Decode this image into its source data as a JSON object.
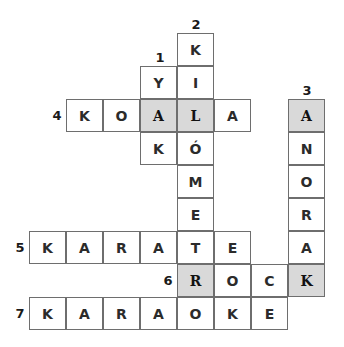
{
  "puzzle": {
    "type": "crossword",
    "cell_size": {
      "w": 37,
      "h": 33
    },
    "origin": {
      "x": 29,
      "y": 33
    },
    "shaded_color": "#d9d9d9",
    "clue_numbers": [
      {
        "n": "1",
        "x": 150,
        "y": 48
      },
      {
        "n": "2",
        "x": 186,
        "y": 15
      },
      {
        "n": "3",
        "x": 297,
        "y": 81
      },
      {
        "n": "4",
        "x": 47,
        "y": 106
      },
      {
        "n": "5",
        "x": 10,
        "y": 238
      },
      {
        "n": "6",
        "x": 158,
        "y": 271
      },
      {
        "n": "7",
        "x": 10,
        "y": 304
      }
    ],
    "words": [
      {
        "number": "1",
        "direction": "down",
        "answer": "YAK"
      },
      {
        "number": "2",
        "direction": "down",
        "answer": "KILÓMETRO"
      },
      {
        "number": "3",
        "direction": "down",
        "answer": "ANORAK"
      },
      {
        "number": "4",
        "direction": "across",
        "answer": "KOALA"
      },
      {
        "number": "5",
        "direction": "across",
        "answer": "KARATE"
      },
      {
        "number": "6",
        "direction": "across",
        "answer": "ROCK"
      },
      {
        "number": "7",
        "direction": "across",
        "answer": "KARAOKE"
      }
    ],
    "cells": [
      {
        "row": 0,
        "col": 4,
        "letter": "K",
        "shaded": false
      },
      {
        "row": 1,
        "col": 3,
        "letter": "Y",
        "shaded": false
      },
      {
        "row": 1,
        "col": 4,
        "letter": "I",
        "shaded": false
      },
      {
        "row": 2,
        "col": 1,
        "letter": "K",
        "shaded": false
      },
      {
        "row": 2,
        "col": 2,
        "letter": "O",
        "shaded": false
      },
      {
        "row": 2,
        "col": 3,
        "letter": "A",
        "shaded": true
      },
      {
        "row": 2,
        "col": 4,
        "letter": "L",
        "shaded": true
      },
      {
        "row": 2,
        "col": 5,
        "letter": "A",
        "shaded": false
      },
      {
        "row": 2,
        "col": 7,
        "letter": "A",
        "shaded": true
      },
      {
        "row": 3,
        "col": 3,
        "letter": "K",
        "shaded": false
      },
      {
        "row": 3,
        "col": 4,
        "letter": "Ó",
        "shaded": false
      },
      {
        "row": 3,
        "col": 7,
        "letter": "N",
        "shaded": false
      },
      {
        "row": 4,
        "col": 4,
        "letter": "M",
        "shaded": false
      },
      {
        "row": 4,
        "col": 7,
        "letter": "O",
        "shaded": false
      },
      {
        "row": 5,
        "col": 4,
        "letter": "E",
        "shaded": false
      },
      {
        "row": 5,
        "col": 7,
        "letter": "R",
        "shaded": false
      },
      {
        "row": 6,
        "col": 0,
        "letter": "K",
        "shaded": false
      },
      {
        "row": 6,
        "col": 1,
        "letter": "A",
        "shaded": false
      },
      {
        "row": 6,
        "col": 2,
        "letter": "R",
        "shaded": false
      },
      {
        "row": 6,
        "col": 3,
        "letter": "A",
        "shaded": false
      },
      {
        "row": 6,
        "col": 4,
        "letter": "T",
        "shaded": false
      },
      {
        "row": 6,
        "col": 5,
        "letter": "E",
        "shaded": false
      },
      {
        "row": 6,
        "col": 7,
        "letter": "A",
        "shaded": false
      },
      {
        "row": 7,
        "col": 4,
        "letter": "R",
        "shaded": true
      },
      {
        "row": 7,
        "col": 5,
        "letter": "O",
        "shaded": false
      },
      {
        "row": 7,
        "col": 6,
        "letter": "C",
        "shaded": false
      },
      {
        "row": 7,
        "col": 7,
        "letter": "K",
        "shaded": true
      },
      {
        "row": 8,
        "col": 0,
        "letter": "K",
        "shaded": false
      },
      {
        "row": 8,
        "col": 1,
        "letter": "A",
        "shaded": false
      },
      {
        "row": 8,
        "col": 2,
        "letter": "R",
        "shaded": false
      },
      {
        "row": 8,
        "col": 3,
        "letter": "A",
        "shaded": false
      },
      {
        "row": 8,
        "col": 4,
        "letter": "O",
        "shaded": false
      },
      {
        "row": 8,
        "col": 5,
        "letter": "K",
        "shaded": false
      },
      {
        "row": 8,
        "col": 6,
        "letter": "E",
        "shaded": false
      }
    ]
  }
}
